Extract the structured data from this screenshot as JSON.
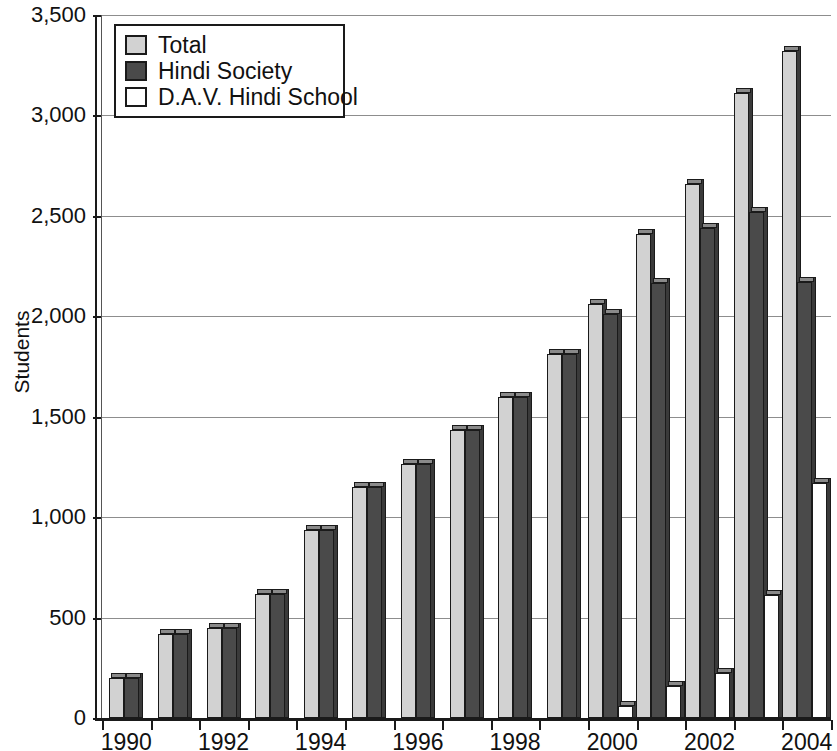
{
  "chart_data": {
    "type": "bar",
    "title": "",
    "xlabel": "",
    "ylabel": "Students",
    "ylim": [
      0,
      3500
    ],
    "ytick_values": [
      0,
      500,
      1000,
      1500,
      2000,
      2500,
      3000,
      3500
    ],
    "ytick_labels": [
      "0",
      "500",
      "1,000",
      "1,500",
      "2,000",
      "2,500",
      "3,000",
      "3,500"
    ],
    "grid": true,
    "legend_position": "top-left",
    "categories": [
      "1990",
      "1991",
      "1992",
      "1993",
      "1994",
      "1995",
      "1996",
      "1997",
      "1998",
      "1999",
      "2000",
      "2001",
      "2002",
      "2003",
      "2004"
    ],
    "xtick_labels_shown": [
      "1990",
      "1992",
      "1994",
      "1996",
      "1998",
      "2000",
      "2002",
      "2004"
    ],
    "series": [
      {
        "name": "Total",
        "color": "#d2d2d2",
        "values": [
          200,
          420,
          450,
          615,
          935,
          1150,
          1265,
          1435,
          1600,
          1810,
          2060,
          2410,
          2660,
          3110,
          3320
        ]
      },
      {
        "name": "Hindi Society",
        "color": "#4a4a4a",
        "values": [
          200,
          420,
          450,
          615,
          935,
          1150,
          1265,
          1435,
          1600,
          1810,
          2010,
          2165,
          2440,
          2520,
          2170
        ]
      },
      {
        "name": "D.A.V. Hindi School",
        "color": "#ffffff",
        "values": [
          0,
          0,
          0,
          0,
          0,
          0,
          0,
          0,
          0,
          0,
          60,
          160,
          225,
          610,
          1170
        ]
      }
    ]
  },
  "legend": {
    "items": [
      {
        "label": "Total",
        "color": "#d2d2d2"
      },
      {
        "label": "Hindi Society",
        "color": "#4a4a4a"
      },
      {
        "label": "D.A.V. Hindi School",
        "color": "#ffffff"
      }
    ]
  },
  "axes": {
    "y_axis_title": "Students"
  }
}
